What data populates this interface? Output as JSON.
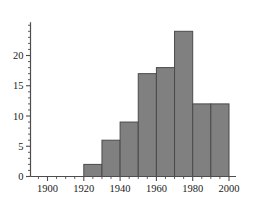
{
  "chart_data": {
    "type": "bar",
    "title": "",
    "subtitle": "",
    "xlabel": "",
    "ylabel": "",
    "categories": [
      "1920-1930",
      "1930-1940",
      "1940-1950",
      "1950-1960",
      "1960-1970",
      "1970-1980",
      "1980-1990",
      "1990-2000"
    ],
    "bin_starts": [
      1920,
      1930,
      1940,
      1950,
      1960,
      1970,
      1980,
      1990
    ],
    "bin_width": 10,
    "values": [
      2,
      6,
      9,
      17,
      18,
      24,
      12,
      12
    ],
    "xlim": [
      1888,
      2012
    ],
    "ylim": [
      0,
      25.5
    ],
    "x_tick_labels": [
      "1900",
      "1920",
      "1940",
      "1960",
      "1980",
      "2000"
    ],
    "x_tick_values": [
      1900,
      1920,
      1940,
      1960,
      1980,
      2000
    ],
    "x_minor_tick_step": 5,
    "y_tick_labels": [
      "0",
      "5",
      "10",
      "15",
      "20"
    ],
    "y_tick_values": [
      0,
      5,
      10,
      15,
      20
    ],
    "y_minor_tick_step": 1,
    "grid": false,
    "legend": null,
    "legend_position": "none",
    "bar_fill_color": "#808080",
    "bar_edge_color": "#4a4a4a",
    "axis_color": "#4d4d4d",
    "text_color": "#1a1a1a",
    "background_color": "#ffffff"
  }
}
